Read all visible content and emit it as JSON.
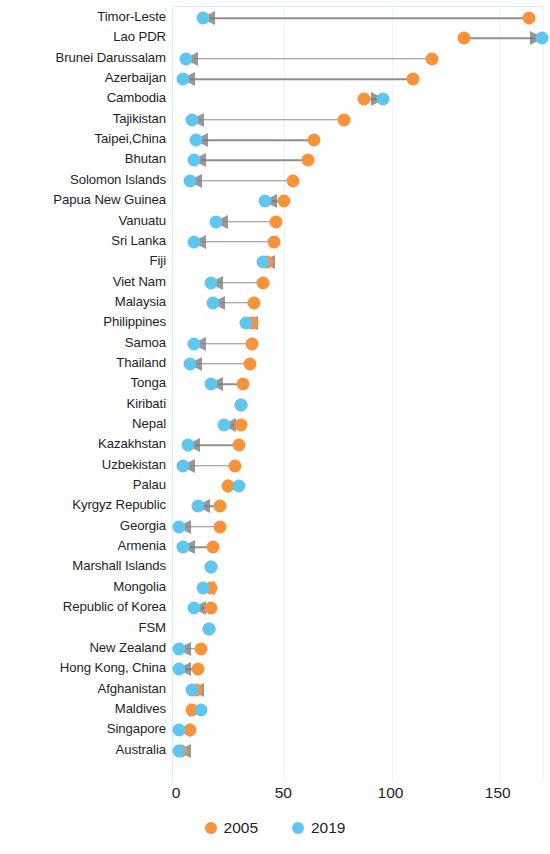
{
  "chart_data": {
    "type": "scatter",
    "subtype": "dumbbell-arrow",
    "title": "",
    "subtitle": "",
    "xlabel": "",
    "ylabel": "",
    "xlim": [
      0,
      172
    ],
    "xticks": [
      0,
      50,
      100,
      150
    ],
    "xtick_labels": [
      "0",
      "50",
      "100",
      "150"
    ],
    "grid": true,
    "grid_axis": "x",
    "legend_position": "bottom",
    "legend": [
      {
        "name": "2005",
        "color": "#f8923b"
      },
      {
        "name": "2019",
        "color": "#5ec6ef"
      }
    ],
    "series": [
      {
        "name": "2005",
        "color": "#f8923b"
      },
      {
        "name": "2019",
        "color": "#5ec6ef"
      }
    ],
    "categories": [
      "Timor-Leste",
      "Lao PDR",
      "Brunei Darussalam",
      "Azerbaijan",
      "Cambodia",
      "Tajikistan",
      "Taipei,China",
      "Bhutan",
      "Solomon Islands",
      "Papua New Guinea",
      "Vanuatu",
      "Sri Lanka",
      "Fiji",
      "Viet Nam",
      "Malaysia",
      "Philippines",
      "Samoa",
      "Thailand",
      "Tonga",
      "Kiribati",
      "Nepal",
      "Kazakhstan",
      "Uzbekistan",
      "Palau",
      "Kyrgyz Republic",
      "Georgia",
      "Armenia",
      "Marshall Islands",
      "Mongolia",
      "Republic of Korea",
      "FSM",
      "New Zealand",
      "Hong Kong, China",
      "Afghanistan",
      "Maldives",
      "Singapore",
      "Australia"
    ],
    "points": [
      {
        "category": "Timor-Leste",
        "v2005": 164,
        "v2019": 12,
        "direction": "left"
      },
      {
        "category": "Lao PDR",
        "v2005": 134,
        "v2019": 170,
        "direction": "right"
      },
      {
        "category": "Brunei Darussalam",
        "v2005": 119,
        "v2019": 4,
        "direction": "left"
      },
      {
        "category": "Azerbaijan",
        "v2005": 110,
        "v2019": 3,
        "direction": "left"
      },
      {
        "category": "Cambodia",
        "v2005": 87,
        "v2019": 96,
        "direction": "right"
      },
      {
        "category": "Tajikistan",
        "v2005": 78,
        "v2019": 7,
        "direction": "left"
      },
      {
        "category": "Taipei,China",
        "v2005": 64,
        "v2019": 9,
        "direction": "left"
      },
      {
        "category": "Bhutan",
        "v2005": 61,
        "v2019": 8,
        "direction": "left"
      },
      {
        "category": "Solomon Islands",
        "v2005": 54,
        "v2019": 6,
        "direction": "left"
      },
      {
        "category": "Papua New Guinea",
        "v2005": 50,
        "v2019": 41,
        "direction": "left"
      },
      {
        "category": "Vanuatu",
        "v2005": 46,
        "v2019": 18,
        "direction": "left"
      },
      {
        "category": "Sri Lanka",
        "v2005": 45,
        "v2019": 8,
        "direction": "left"
      },
      {
        "category": "Fiji",
        "v2005": 42,
        "v2019": 40,
        "direction": "left"
      },
      {
        "category": "Viet Nam",
        "v2005": 40,
        "v2019": 16,
        "direction": "left"
      },
      {
        "category": "Malaysia",
        "v2005": 36,
        "v2019": 17,
        "direction": "left"
      },
      {
        "category": "Philippines",
        "v2005": 35,
        "v2019": 32,
        "direction": "left"
      },
      {
        "category": "Samoa",
        "v2005": 35,
        "v2019": 8,
        "direction": "left"
      },
      {
        "category": "Thailand",
        "v2005": 34,
        "v2019": 6,
        "direction": "left"
      },
      {
        "category": "Tonga",
        "v2005": 31,
        "v2019": 16,
        "direction": "left"
      },
      {
        "category": "Kiribati",
        "v2005": 30,
        "v2019": 30,
        "direction": "none"
      },
      {
        "category": "Nepal",
        "v2005": 30,
        "v2019": 22,
        "direction": "left"
      },
      {
        "category": "Kazakhstan",
        "v2005": 29,
        "v2019": 5,
        "direction": "left"
      },
      {
        "category": "Uzbekistan",
        "v2005": 27,
        "v2019": 3,
        "direction": "left"
      },
      {
        "category": "Palau",
        "v2005": 24,
        "v2019": 29,
        "direction": "right"
      },
      {
        "category": "Kyrgyz Republic",
        "v2005": 20,
        "v2019": 10,
        "direction": "left"
      },
      {
        "category": "Georgia",
        "v2005": 20,
        "v2019": 1,
        "direction": "left"
      },
      {
        "category": "Armenia",
        "v2005": 17,
        "v2019": 3,
        "direction": "left"
      },
      {
        "category": "Marshall Islands",
        "v2005": 16,
        "v2019": 16,
        "direction": "none"
      },
      {
        "category": "Mongolia",
        "v2005": 16,
        "v2019": 12,
        "direction": "left"
      },
      {
        "category": "Republic of Korea",
        "v2005": 16,
        "v2019": 8,
        "direction": "left"
      },
      {
        "category": "FSM",
        "v2005": 15,
        "v2019": 15,
        "direction": "none"
      },
      {
        "category": "New Zealand",
        "v2005": 11,
        "v2019": 1,
        "direction": "left"
      },
      {
        "category": "Hong Kong, China",
        "v2005": 10,
        "v2019": 1,
        "direction": "left"
      },
      {
        "category": "Afghanistan",
        "v2005": 9,
        "v2019": 7,
        "direction": "left"
      },
      {
        "category": "Maldives",
        "v2005": 7,
        "v2019": 11,
        "direction": "right"
      },
      {
        "category": "Singapore",
        "v2005": 6,
        "v2019": 1,
        "direction": "left"
      },
      {
        "category": "Australia",
        "v2005": 2,
        "v2019": 1,
        "direction": "left"
      }
    ]
  },
  "colors": {
    "y2005": "#f8923b",
    "y2019": "#5ec6ef",
    "arrow": "#7b7b7b",
    "grid": "#e8f5fa",
    "axis": "#d2eef7",
    "text": "#221f1f"
  }
}
